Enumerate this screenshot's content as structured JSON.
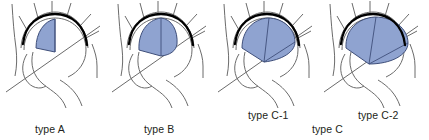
{
  "figure": {
    "kind": "medical-classification-diagram",
    "background_color": "#ffffff",
    "width": 429,
    "height": 140
  },
  "style": {
    "lesion_fill": "#8fa3d0",
    "lesion_stroke": "#3f4f7a",
    "outline_stroke": "#6b6b6b",
    "weightbearing_stroke": "#000000",
    "text_color": "#231f20"
  },
  "labels": {
    "type_a": "type A",
    "type_b": "type B",
    "type_c": "type C",
    "type_c1": "type C-1",
    "type_c2": "type C-2"
  },
  "panels": [
    {
      "id": "type-a",
      "label": "type A",
      "lesion_extent": "medial one-third or less of weight-bearing surface",
      "lesion_relative_size": 0.22
    },
    {
      "id": "type-b",
      "label": "type B",
      "lesion_extent": "medial two-thirds of weight-bearing surface",
      "lesion_relative_size": 0.45
    },
    {
      "id": "type-c1",
      "label": "type C-1",
      "lesion_extent": "more than medial two-thirds, not beyond acetabular edge",
      "lesion_relative_size": 0.72
    },
    {
      "id": "type-c2",
      "label": "type C-2",
      "lesion_extent": "extends laterally beyond the acetabular edge",
      "lesion_relative_size": 0.95
    }
  ]
}
